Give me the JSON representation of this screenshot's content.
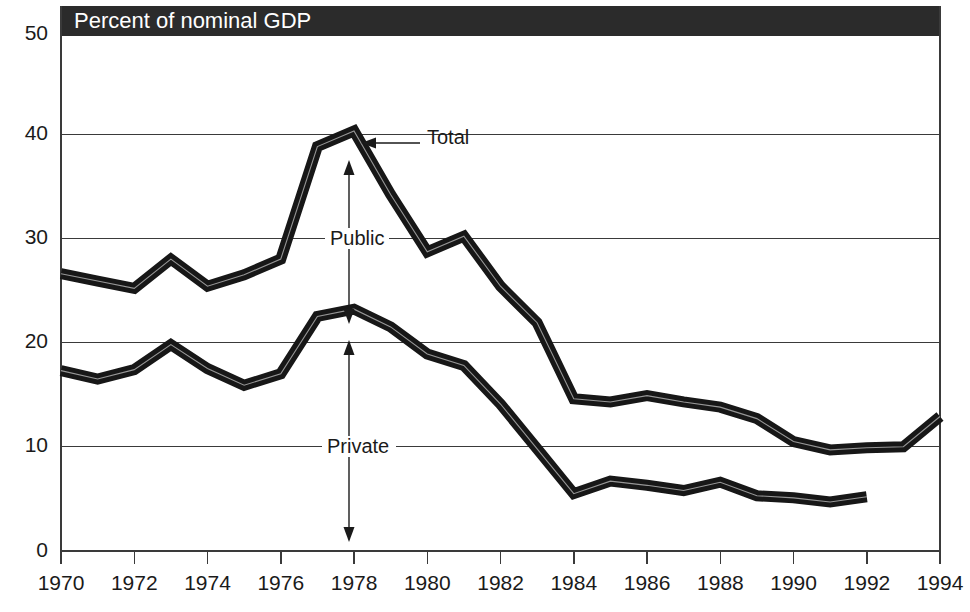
{
  "header": {
    "label": "Percent of nominal GDP",
    "background_color": "#2b2b2b",
    "text_color": "#ffffff"
  },
  "annotations": {
    "total_label": "Total",
    "public_label": "Public",
    "private_label": "Private"
  },
  "chart_data": {
    "type": "line",
    "title": "Percent of nominal GDP",
    "xlabel": "",
    "ylabel": "",
    "xlim": [
      1970,
      1994
    ],
    "ylim": [
      0,
      50
    ],
    "ytick_labels": [
      "0",
      "10",
      "20",
      "30",
      "40",
      "50"
    ],
    "yticks": [
      0,
      10,
      20,
      30,
      40,
      50
    ],
    "xtick_labels": [
      "1970",
      "1972",
      "1974",
      "1976",
      "1978",
      "1980",
      "1982",
      "1984",
      "1986",
      "1988",
      "1990",
      "1992",
      "1994"
    ],
    "xticks": [
      1970,
      1972,
      1974,
      1976,
      1978,
      1980,
      1982,
      1984,
      1986,
      1988,
      1990,
      1992,
      1994
    ],
    "grid": true,
    "legend_position": "inline-annotations",
    "line_color": "#171717",
    "series": [
      {
        "name": "Total",
        "x": [
          1970,
          1971,
          1972,
          1973,
          1974,
          1975,
          1976,
          1977,
          1978,
          1979,
          1980,
          1981,
          1982,
          1983,
          1984,
          1985,
          1986,
          1987,
          1988,
          1989,
          1990,
          1991,
          1992,
          1993,
          1994
        ],
        "values": [
          26.6,
          25.9,
          25.2,
          28.0,
          25.4,
          26.5,
          28.0,
          38.8,
          40.3,
          34.2,
          28.7,
          30.2,
          25.4,
          21.9,
          14.6,
          14.3,
          14.9,
          14.3,
          13.8,
          12.7,
          10.5,
          9.7,
          9.9,
          10.0,
          12.9
        ]
      },
      {
        "name": "Private",
        "x": [
          1970,
          1971,
          1972,
          1973,
          1974,
          1975,
          1976,
          1977,
          1978,
          1979,
          1980,
          1981,
          1982,
          1983,
          1984,
          1985,
          1986,
          1987,
          1988,
          1989,
          1990,
          1991,
          1992
        ],
        "values": [
          17.3,
          16.5,
          17.4,
          19.8,
          17.5,
          15.9,
          17.0,
          22.5,
          23.2,
          21.5,
          18.9,
          17.8,
          14.1,
          9.8,
          5.5,
          6.7,
          6.3,
          5.8,
          6.6,
          5.3,
          5.1,
          4.7,
          5.2
        ]
      }
    ],
    "notes": [
      "Public = vertical gap between Total and Private series",
      "Private = area from zero up to Private series"
    ]
  }
}
